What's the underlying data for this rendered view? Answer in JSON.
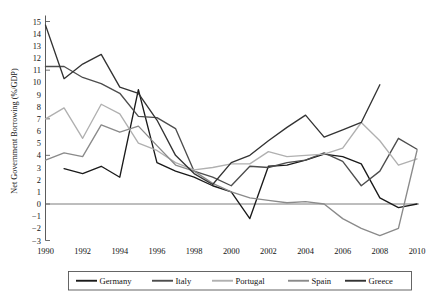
{
  "chart_data": {
    "type": "line",
    "title": "",
    "xlabel": "",
    "ylabel": "Net Government Borrowing (%/GDP)",
    "x": [
      1990,
      1991,
      1992,
      1993,
      1994,
      1995,
      1996,
      1997,
      1998,
      1999,
      2000,
      2001,
      2002,
      2003,
      2004,
      2005,
      2006,
      2007,
      2008,
      2009,
      2010
    ],
    "xlim": [
      1990,
      2010
    ],
    "ylim": [
      -3,
      15
    ],
    "xticks": [
      1990,
      1992,
      1994,
      1996,
      1998,
      2000,
      2002,
      2004,
      2006,
      2008,
      2010
    ],
    "yticks": [
      -3,
      -2,
      -1,
      0,
      1,
      2,
      3,
      4,
      5,
      6,
      7,
      8,
      9,
      10,
      11,
      12,
      13,
      14,
      15
    ],
    "grid": false,
    "zero_line": true,
    "legend_position": "bottom",
    "series": [
      {
        "name": "Germany",
        "color": "#1a1a1a",
        "values": [
          null,
          2.9,
          2.5,
          3.1,
          2.2,
          9.4,
          3.4,
          2.7,
          2.2,
          1.5,
          1.0,
          -1.2,
          3.1,
          3.2,
          3.6,
          4.1,
          3.9,
          3.3,
          0.5,
          -0.3,
          0.0
        ]
      },
      {
        "name": "Italy",
        "color": "#4d4d4d",
        "values": [
          11.3,
          11.3,
          10.4,
          9.9,
          9.1,
          7.2,
          7.1,
          6.2,
          2.7,
          2.2,
          1.5,
          3.1,
          3.0,
          3.4,
          3.6,
          4.2,
          3.5,
          1.5,
          2.7,
          5.4,
          4.5
        ]
      },
      {
        "name": "Portugal",
        "color": "#b0b0b0",
        "values": [
          7.0,
          7.9,
          5.4,
          8.2,
          7.4,
          5.0,
          4.4,
          3.4,
          2.8,
          3.0,
          3.3,
          3.3,
          4.3,
          3.9,
          4.0,
          4.1,
          4.6,
          6.7,
          5.2,
          3.2,
          3.7
        ]
      },
      {
        "name": "Spain",
        "color": "#8a8a8a",
        "values": [
          3.6,
          4.2,
          3.9,
          6.5,
          5.9,
          6.4,
          4.8,
          3.2,
          2.7,
          1.7,
          1.0,
          0.5,
          0.3,
          0.1,
          0.2,
          0.0,
          -1.2,
          -2.0,
          -2.6,
          -2.0,
          4.4
        ]
      },
      {
        "name": "Greece",
        "color": "#333333",
        "values": [
          14.7,
          10.3,
          11.5,
          12.3,
          9.6,
          9.1,
          6.9,
          4.0,
          2.5,
          1.6,
          3.4,
          4.0,
          5.2,
          6.3,
          7.3,
          5.5,
          6.1,
          6.7,
          9.8,
          null,
          null
        ]
      }
    ]
  },
  "legend": {
    "items": [
      {
        "label": "Germany"
      },
      {
        "label": "Italy"
      },
      {
        "label": "Portugal"
      },
      {
        "label": "Spain"
      },
      {
        "label": "Greece"
      }
    ]
  },
  "axes": {
    "y_title": "Net Government Borrowing (%/GDP)",
    "y_tick_labels": [
      "15",
      "14",
      "13",
      "12",
      "11",
      "10",
      "9",
      "8",
      "7",
      "6",
      "5",
      "4",
      "3",
      "2",
      "1",
      "0",
      "−1",
      "−2",
      "−3"
    ],
    "x_tick_labels": [
      "1990",
      "1992",
      "1994",
      "1996",
      "1998",
      "2000",
      "2002",
      "2004",
      "2006",
      "2008",
      "2010"
    ]
  }
}
